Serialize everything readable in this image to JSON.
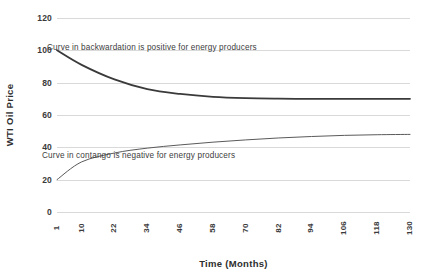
{
  "chart_data": {
    "type": "line",
    "title": "",
    "subtitle": "",
    "xlabel": "Time (Months)",
    "ylabel": "WTI Oil Price",
    "xlim": [
      1,
      130
    ],
    "ylim": [
      0,
      120
    ],
    "grid": true,
    "legend": "none",
    "y_ticks": [
      120,
      100,
      80,
      60,
      40,
      20,
      0
    ],
    "x_ticks": [
      1,
      10,
      22,
      34,
      46,
      58,
      70,
      82,
      94,
      106,
      118,
      130
    ],
    "x": [
      1,
      10,
      22,
      34,
      46,
      58,
      70,
      82,
      94,
      106,
      118,
      130
    ],
    "series": [
      {
        "name": "Curve in backwardation",
        "color": "#3a3a3a",
        "width": 1.8,
        "values": [
          100.0,
          91.0,
          82.0,
          76.0,
          73.0,
          71.2,
          70.4,
          70.1,
          70.0,
          70.0,
          70.0,
          70.0
        ]
      },
      {
        "name": "Curve in contango",
        "color": "#5a5a5a",
        "width": 1.0,
        "values": [
          20.0,
          31.0,
          36.5,
          39.5,
          41.5,
          43.2,
          44.6,
          45.8,
          46.7,
          47.4,
          47.8,
          48.0
        ]
      }
    ],
    "annotations": [
      {
        "id": "backwardation",
        "text": "Curve in backwardation is positive for energy producers",
        "x": 22,
        "y": 88
      },
      {
        "id": "contango",
        "text": "Curve in contango is negative for energy producers",
        "x": 20,
        "y": 30
      }
    ]
  },
  "axes": {
    "y_title": "WTI Oil Price",
    "x_title": "Time (Months)",
    "y_tick_labels": [
      "120",
      "100",
      "80",
      "60",
      "40",
      "20",
      "0"
    ],
    "x_tick_labels": [
      "1",
      "10",
      "22",
      "34",
      "46",
      "58",
      "70",
      "82",
      "94",
      "106",
      "118",
      "130"
    ]
  },
  "annotations": {
    "backwardation": "Curve in backwardation is positive for energy producers",
    "contango": "Curve in contango is negative for energy producers"
  },
  "colors": {
    "gridline": "#d9d9d9",
    "backwardation_curve": "#3a3a3a",
    "contango_curve": "#5a5a5a",
    "text": "#3a3a3a",
    "background": "#ffffff"
  }
}
